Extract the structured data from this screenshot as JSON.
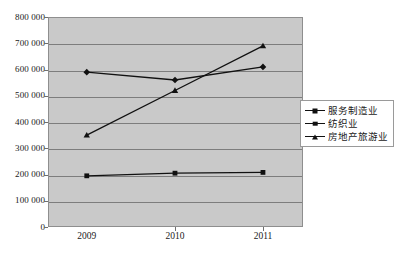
{
  "chart_data": {
    "type": "line",
    "title": "",
    "xlabel": "",
    "ylabel": "",
    "categories": [
      "2009",
      "2010",
      "2011"
    ],
    "ylim": [
      0,
      800000
    ],
    "ytick_step": 100000,
    "ytick_labels": [
      "800 000",
      "700 000",
      "600 000",
      "500 000",
      "400 000",
      "300 000",
      "200 000",
      "100 000",
      "0"
    ],
    "ytick_values": [
      800000,
      700000,
      600000,
      500000,
      400000,
      300000,
      200000,
      100000,
      0
    ],
    "grid": true,
    "legend_position": "right",
    "plot_background": "#c9c9c9",
    "gridline_color": "#7d7d7d",
    "series_color": "#111111",
    "series": [
      {
        "name": "服务制造业",
        "marker": "diamond",
        "values": [
          590000,
          560000,
          610000
        ]
      },
      {
        "name": "纺织业",
        "marker": "square",
        "values": [
          195000,
          205000,
          208000
        ]
      },
      {
        "name": "房地产旅游业",
        "marker": "triangle",
        "values": [
          350000,
          520000,
          690000
        ]
      }
    ]
  },
  "legend": {
    "items": [
      {
        "label": "服务制造业",
        "marker": "diamond"
      },
      {
        "label": "纺织业",
        "marker": "square"
      },
      {
        "label": "房地产旅游业",
        "marker": "triangle"
      }
    ]
  },
  "axes": {
    "y": {
      "labels": [
        "800 000",
        "700 000",
        "600 000",
        "500 000",
        "400 000",
        "300 000",
        "200 000",
        "100 000",
        "0"
      ]
    },
    "x": {
      "labels": [
        "2009",
        "2010",
        "2011"
      ]
    }
  }
}
